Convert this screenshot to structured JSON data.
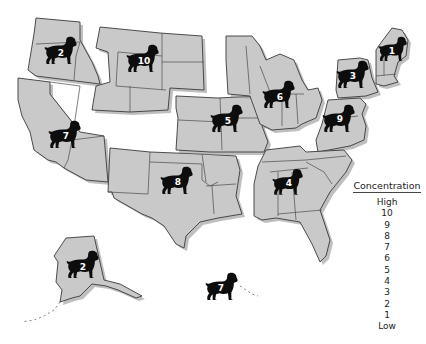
{
  "map": {
    "title": "US dog concentration by region",
    "base_color": "#c9c9c9",
    "marker_color": "#0d0d0d",
    "marker_icon": "dog-silhouette-icon",
    "regions": [
      {
        "id": "northwest",
        "label": "2",
        "states": [
          "Washington",
          "Oregon",
          "Idaho"
        ]
      },
      {
        "id": "mountain-north",
        "label": "10",
        "states": [
          "Montana",
          "Wyoming",
          "Colorado",
          "Utah",
          "North Dakota",
          "South Dakota"
        ]
      },
      {
        "id": "southwest",
        "label": "7",
        "states": [
          "California",
          "Nevada",
          "Arizona"
        ]
      },
      {
        "id": "south-central",
        "label": "8",
        "states": [
          "New Mexico",
          "Texas",
          "Oklahoma",
          "Arkansas",
          "Louisiana"
        ]
      },
      {
        "id": "plains",
        "label": "5",
        "states": [
          "Nebraska",
          "Kansas",
          "Iowa",
          "Missouri"
        ]
      },
      {
        "id": "great-lakes",
        "label": "6",
        "states": [
          "Minnesota",
          "Wisconsin",
          "Michigan",
          "Illinois",
          "Indiana",
          "Ohio"
        ]
      },
      {
        "id": "new-york",
        "label": "3",
        "states": [
          "New York"
        ]
      },
      {
        "id": "new-england",
        "label": "1",
        "states": [
          "Maine",
          "Vermont",
          "New Hampshire",
          "Massachusetts",
          "Connecticut",
          "Rhode Island"
        ]
      },
      {
        "id": "mid-atlantic",
        "label": "9",
        "states": [
          "Pennsylvania",
          "New Jersey",
          "West Virginia",
          "Virginia",
          "Maryland",
          "Delaware"
        ]
      },
      {
        "id": "southeast",
        "label": "4",
        "states": [
          "Kentucky",
          "Tennessee",
          "North Carolina",
          "South Carolina",
          "Georgia",
          "Alabama",
          "Mississippi",
          "Florida"
        ]
      },
      {
        "id": "alaska",
        "label": "2",
        "states": [
          "Alaska"
        ]
      },
      {
        "id": "hawaii",
        "label": "7",
        "states": [
          "Hawaii"
        ]
      }
    ]
  },
  "legend": {
    "title": "Concentration",
    "items": [
      "High",
      "10",
      "9",
      "8",
      "7",
      "6",
      "5",
      "4",
      "3",
      "2",
      "1",
      "Low"
    ]
  }
}
